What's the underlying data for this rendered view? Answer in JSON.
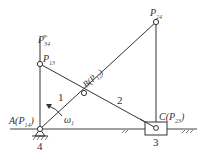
{
  "diagram": {
    "type": "slider-crank mechanism instant centers",
    "stroke_color": "#333333",
    "points": {
      "A": {
        "label": "A(P",
        "sub": "14",
        "close": ")",
        "x": 40,
        "y": 129
      },
      "P13": {
        "label": "P",
        "sub": "13",
        "x": 40,
        "y": 64
      },
      "P34inf": {
        "label": "P",
        "sub": "34",
        "sup": "∞",
        "x": 40,
        "y": 38
      },
      "B": {
        "label": "B(P",
        "sub": "12",
        "close": ")",
        "x": 84,
        "y": 93
      },
      "P24": {
        "label": "P",
        "sub": "24",
        "x": 156,
        "y": 22
      },
      "C": {
        "label": "C(P",
        "sub": "23",
        "close": ")",
        "x": 156,
        "y": 128
      }
    },
    "links": [
      {
        "id": "1",
        "label": "1"
      },
      {
        "id": "2",
        "label": "2"
      },
      {
        "id": "3",
        "label": "3"
      },
      {
        "id": "4",
        "label": "4"
      }
    ],
    "angular_velocity": {
      "label": "ω",
      "sub": "1"
    }
  }
}
